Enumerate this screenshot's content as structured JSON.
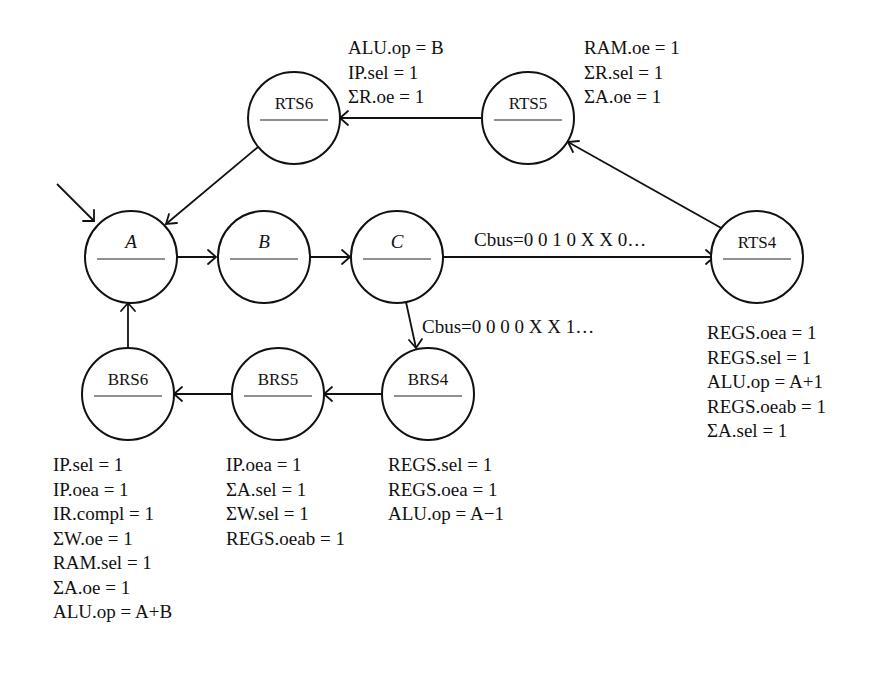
{
  "diagram": {
    "type": "state-machine",
    "nodes": [
      {
        "id": "A",
        "label": "A",
        "italic": true,
        "cx": 131,
        "cy": 257
      },
      {
        "id": "B",
        "label": "B",
        "italic": true,
        "cx": 264,
        "cy": 257
      },
      {
        "id": "C",
        "label": "C",
        "italic": true,
        "cx": 397,
        "cy": 257
      },
      {
        "id": "RTS4",
        "label": "RTS4",
        "italic": false,
        "cx": 757,
        "cy": 257
      },
      {
        "id": "RTS5",
        "label": "RTS5",
        "italic": false,
        "cx": 528,
        "cy": 118
      },
      {
        "id": "RTS6",
        "label": "RTS6",
        "italic": false,
        "cx": 294,
        "cy": 118
      },
      {
        "id": "BRS4",
        "label": "BRS4",
        "italic": false,
        "cx": 428,
        "cy": 394
      },
      {
        "id": "BRS5",
        "label": "BRS5",
        "italic": false,
        "cx": 278,
        "cy": 394
      },
      {
        "id": "BRS6",
        "label": "BRS6",
        "italic": false,
        "cx": 128,
        "cy": 394
      }
    ],
    "edges": [
      {
        "from": "start",
        "to": "A",
        "label": ""
      },
      {
        "from": "A",
        "to": "B",
        "label": ""
      },
      {
        "from": "B",
        "to": "C",
        "label": ""
      },
      {
        "from": "C",
        "to": "RTS4",
        "label": "Cbus=0 0 1 0 X X 0…"
      },
      {
        "from": "RTS4",
        "to": "RTS5",
        "label": ""
      },
      {
        "from": "RTS5",
        "to": "RTS6",
        "label": ""
      },
      {
        "from": "RTS6",
        "to": "A",
        "label": ""
      },
      {
        "from": "C",
        "to": "BRS4",
        "label": "Cbus=0 0 0 0 X X 1…"
      },
      {
        "from": "BRS4",
        "to": "BRS5",
        "label": ""
      },
      {
        "from": "BRS5",
        "to": "BRS6",
        "label": ""
      },
      {
        "from": "BRS6",
        "to": "A",
        "label": ""
      }
    ],
    "edge_labels": {
      "c_to_rts4": "Cbus=0 0 1 0 X X 0…",
      "c_to_brs4": "Cbus=0 0 0 0 X X 1…"
    },
    "annotations": {
      "RTS6": [
        "ALU.op = B",
        "IP.sel = 1",
        "ΣR.oe = 1"
      ],
      "RTS5": [
        "RAM.oe = 1",
        "ΣR.sel = 1",
        "ΣA.oe = 1"
      ],
      "RTS4": [
        "REGS.oea = 1",
        "REGS.sel = 1",
        "ALU.op = A+1",
        "REGS.oeab = 1",
        "ΣA.sel = 1"
      ],
      "BRS6": [
        "IP.sel = 1",
        "IP.oea = 1",
        "IR.compl = 1",
        "ΣW.oe = 1",
        "RAM.sel = 1",
        "ΣA.oe = 1",
        "ALU.op = A+B"
      ],
      "BRS5": [
        "IP.oea = 1",
        "ΣA.sel = 1",
        "ΣW.sel = 1",
        "REGS.oeab = 1"
      ],
      "BRS4": [
        "REGS.sel = 1",
        "REGS.oea = 1",
        "ALU.op = A−1"
      ]
    }
  }
}
